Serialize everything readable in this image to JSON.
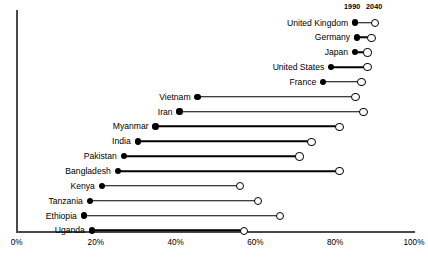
{
  "chart_data": {
    "type": "bar",
    "subtype": "dumbbell",
    "title": "",
    "xlabel": "",
    "ylabel": "",
    "xlim": [
      0,
      100
    ],
    "grid": false,
    "legend_position": "top-right",
    "series": [
      {
        "name": "1990",
        "marker": "filled-circle"
      },
      {
        "name": "2040",
        "marker": "open-circle"
      }
    ],
    "categories": [
      "United Kingdom",
      "Germany",
      "Japan",
      "United States",
      "France",
      "Vietnam",
      "Iran",
      "Myanmar",
      "India",
      "Pakistan",
      "Bangladesh",
      "Kenya",
      "Tanzania",
      "Ethiopia",
      "Uganda"
    ],
    "rows": [
      {
        "label": "United Kingdom",
        "start": 85.0,
        "end": 90.0
      },
      {
        "label": "Germany",
        "start": 85.5,
        "end": 89.0
      },
      {
        "label": "Japan",
        "start": 85.0,
        "end": 88.0
      },
      {
        "label": "United States",
        "start": 79.0,
        "end": 88.0
      },
      {
        "label": "France",
        "start": 77.0,
        "end": 86.5
      },
      {
        "label": "Vietnam",
        "start": 45.5,
        "end": 85.0
      },
      {
        "label": "Iran",
        "start": 41.0,
        "end": 87.0
      },
      {
        "label": "Myanmar",
        "start": 35.0,
        "end": 81.0
      },
      {
        "label": "India",
        "start": 30.5,
        "end": 74.0
      },
      {
        "label": "Pakistan",
        "start": 27.0,
        "end": 71.0
      },
      {
        "label": "Bangladesh",
        "start": 25.5,
        "end": 81.0
      },
      {
        "label": "Kenya",
        "start": 21.5,
        "end": 56.0
      },
      {
        "label": "Tanzania",
        "start": 18.5,
        "end": 60.5
      },
      {
        "label": "Ethiopia",
        "start": 17.0,
        "end": 66.0
      },
      {
        "label": "Uganda",
        "start": 19.0,
        "end": 57.0
      }
    ],
    "xticks": [
      {
        "value": 0,
        "label": "0%"
      },
      {
        "value": 20,
        "label": "20%"
      },
      {
        "value": 40,
        "label": "40%"
      },
      {
        "value": 60,
        "label": "60%"
      },
      {
        "value": 80,
        "label": "80%"
      },
      {
        "value": 100,
        "label": "100%"
      }
    ]
  },
  "legend": {
    "left_label": "1990",
    "right_label": "2040"
  },
  "colors": {
    "marker": "#000000",
    "axis": "#4a4a4a",
    "background": "#ffffff"
  }
}
